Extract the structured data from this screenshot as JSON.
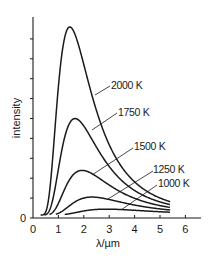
{
  "chart_data": {
    "type": "line",
    "title": "",
    "xlabel": "λ/µm",
    "ylabel": "intensity",
    "xlim": [
      0,
      6.6
    ],
    "ylim": [
      0,
      1.1
    ],
    "x_ticks": [
      0,
      1,
      2,
      3,
      4,
      5,
      6
    ],
    "x_tick_labels": [
      "0",
      "1",
      "2",
      "3",
      "4",
      "5",
      "6"
    ],
    "y_tick_labels": [
      "0"
    ],
    "y_minor_tick_count": 9,
    "grid": false,
    "legend": "inline labels with leader lines",
    "series": [
      {
        "name": "2000 K",
        "temperature_K": 2000,
        "peak_wavelength_um": 1.45,
        "relative_peak_intensity": 1.0,
        "x_start": 0.3,
        "x_end": 5.4
      },
      {
        "name": "1750 K",
        "temperature_K": 1750,
        "peak_wavelength_um": 1.66,
        "relative_peak_intensity": 0.51,
        "x_start": 0.45,
        "x_end": 5.4
      },
      {
        "name": "1500 K",
        "temperature_K": 1500,
        "peak_wavelength_um": 1.93,
        "relative_peak_intensity": 0.24,
        "x_start": 0.65,
        "x_end": 5.4
      },
      {
        "name": "1250 K",
        "temperature_K": 1250,
        "peak_wavelength_um": 2.32,
        "relative_peak_intensity": 0.095,
        "x_start": 0.9,
        "x_end": 5.4
      },
      {
        "name": "1000 K",
        "temperature_K": 1000,
        "peak_wavelength_um": 2.9,
        "relative_peak_intensity": 0.031,
        "x_start": 1.25,
        "x_end": 5.4
      }
    ]
  },
  "labels": {
    "x_axis": "λ/µm",
    "y_axis": "intensity",
    "origin_y": "0",
    "curves": [
      "2000 K",
      "1750 K",
      "1500 K",
      "1250 K",
      "1000 K"
    ]
  }
}
